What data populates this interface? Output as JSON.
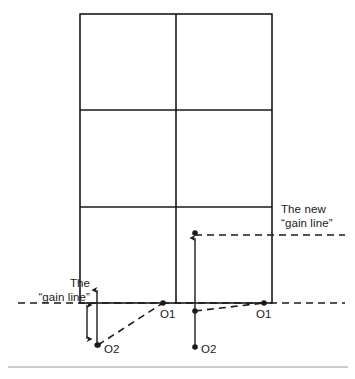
{
  "figure": {
    "type": "line-diagram",
    "background": "#ffffff",
    "stroke_color": "#1a1a1a",
    "caption_rule": true
  },
  "grid": {
    "name": "pitch-grid",
    "left": 80,
    "right": 272,
    "top": 14,
    "bottom": 303,
    "vertical_dividers": [
      176
    ],
    "horizontal_dividers": [
      110,
      207
    ],
    "columns": 2,
    "rows": 3
  },
  "labels": {
    "gain_line": {
      "line1": "The",
      "line2": "“gain line”",
      "x": 18,
      "y": 276
    },
    "new_gain_line": {
      "line1": "The new",
      "line2": "“gain line”",
      "x": 281,
      "y": 202
    }
  },
  "points": {
    "left_o1": {
      "label": "O1",
      "x": 163,
      "y": 303,
      "label_x": 160,
      "label_y": 309
    },
    "left_o2": {
      "label": "O2",
      "x": 98,
      "y": 345,
      "label_x": 104,
      "label_y": 344
    },
    "right_o1": {
      "label": "O1",
      "x": 264,
      "y": 303,
      "label_x": 256,
      "label_y": 309
    },
    "right_o2": {
      "label": "O2",
      "x": 195,
      "y": 347,
      "label_x": 201,
      "label_y": 344
    },
    "right_o2_marker": {
      "x": 195,
      "y": 311
    },
    "right_arrow_top": {
      "x": 195,
      "y": 233
    }
  },
  "lines": {
    "gain_line_dash": {
      "y": 303,
      "x_start": 18,
      "x_end": 345,
      "style": "dashed"
    },
    "new_gain_line_dash": {
      "y": 235,
      "x_start": 195,
      "x_end": 345,
      "style": "dashed"
    },
    "left_dashed_run": {
      "from_x": 98,
      "from_y": 345,
      "to_x": 163,
      "to_y": 303,
      "style": "dashed"
    },
    "right_dashed_run": {
      "from_x": 195,
      "from_y": 311,
      "to_x": 264,
      "to_y": 303,
      "style": "dashed"
    },
    "left_double_arrow": {
      "x": 87,
      "y_top": 303,
      "y_bottom": 341
    },
    "left_up_arrow": {
      "x": 97,
      "y_top": 288,
      "y_bottom": 345
    },
    "right_up_arrow": {
      "x": 195,
      "y_top": 235,
      "y_bottom": 347
    },
    "caption_rule": {
      "y": 367,
      "x_start": 8,
      "x_end": 348
    }
  }
}
